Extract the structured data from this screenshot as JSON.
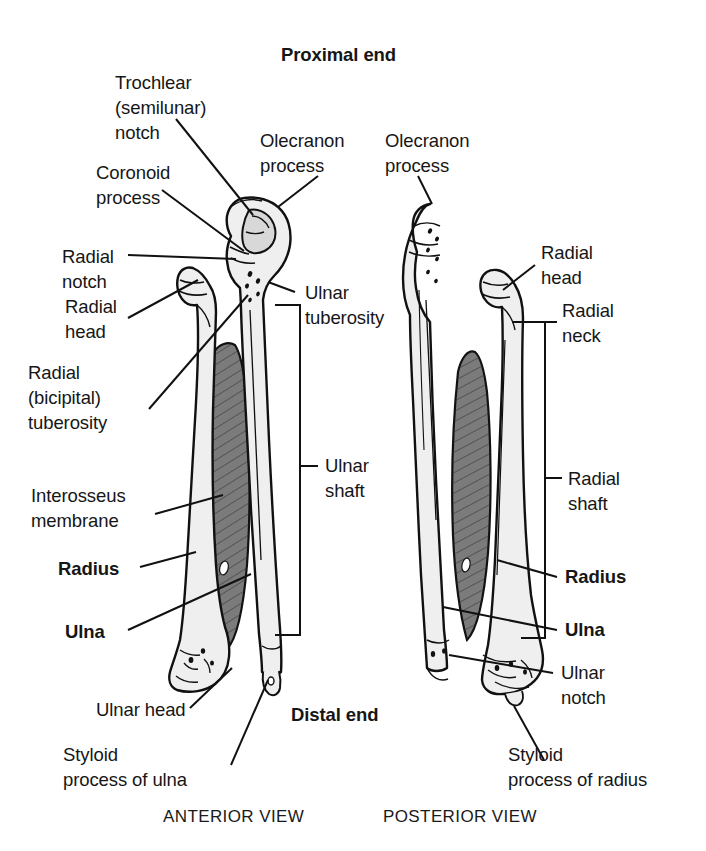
{
  "figure": {
    "title_top": "Proximal end",
    "title_bottom": "Distal end",
    "caption_left": "ANTERIOR VIEW",
    "caption_right": "POSTERIOR VIEW"
  },
  "colors": {
    "outline": "#111111",
    "bone_fill": "#efefef",
    "membrane_fill": "#7b7b7b",
    "membrane_hatch": "#2a2a2a",
    "text": "#161616",
    "background": "#ffffff"
  },
  "anterior_view": {
    "name": "ANTERIOR VIEW",
    "labels_left": [
      {
        "id": "trochlear-notch",
        "text": "Trochlear\n(semilunar)\nnotch"
      },
      {
        "id": "coronoid-process",
        "text": "Coronoid\nprocess"
      },
      {
        "id": "radial-notch",
        "text": "Radial\nnotch"
      },
      {
        "id": "radial-head",
        "text": "Radial\nhead"
      },
      {
        "id": "radial-bicipital-tuberosity",
        "text": "Radial\n(bicipital)\ntuberosity"
      },
      {
        "id": "interosseus-membrane",
        "text": "Interosseus\nmembrane"
      },
      {
        "id": "radius",
        "text": "Radius",
        "bold": true
      },
      {
        "id": "ulna",
        "text": "Ulna",
        "bold": true
      },
      {
        "id": "ulnar-head",
        "text": "Ulnar head"
      },
      {
        "id": "styloid-process-of-ulna",
        "text": "Styloid\nprocess of ulna"
      }
    ],
    "labels_right": [
      {
        "id": "olecranon-process",
        "text": "Olecranon\nprocess"
      },
      {
        "id": "ulnar-tuberosity",
        "text": "Ulnar\ntuberosity"
      },
      {
        "id": "ulnar-shaft",
        "text": "Ulnar\nshaft",
        "bracket": true
      }
    ]
  },
  "posterior_view": {
    "name": "POSTERIOR VIEW",
    "labels_left": [
      {
        "id": "olecranon-process",
        "text": "Olecranon\nprocess"
      }
    ],
    "labels_right": [
      {
        "id": "radial-head",
        "text": "Radial\nhead"
      },
      {
        "id": "radial-neck",
        "text": "Radial\nneck"
      },
      {
        "id": "radial-shaft",
        "text": "Radial\nshaft",
        "bracket": true
      },
      {
        "id": "radius",
        "text": "Radius",
        "bold": true
      },
      {
        "id": "ulna",
        "text": "Ulna",
        "bold": true
      },
      {
        "id": "ulnar-notch",
        "text": "Ulnar\nnotch"
      },
      {
        "id": "styloid-process-of-radius",
        "text": "Styloid\nprocess of radius"
      }
    ]
  }
}
